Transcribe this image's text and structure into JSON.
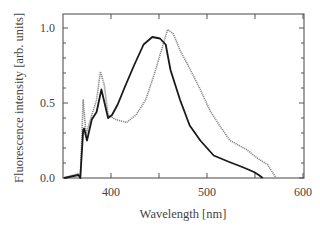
{
  "chart_data": {
    "type": "line",
    "title": "",
    "xlabel": "Wavelength [nm]",
    "ylabel": "Fluorescence intensity [arb. units]",
    "xlim": [
      350,
      600
    ],
    "ylim": [
      0.0,
      1.0
    ],
    "x_ticks": [
      400,
      500,
      600
    ],
    "x_minor_ticks": [
      450,
      550
    ],
    "y_ticks": [
      "0.0",
      "0.5",
      "1.0"
    ],
    "grid": false,
    "legend": null,
    "series": [
      {
        "name": "solid (black)",
        "color": "#1a1a1a",
        "style": "solid",
        "x": [
          351,
          366,
          368,
          371,
          372,
          375,
          380,
          385,
          390,
          397,
          401,
          407,
          414,
          424,
          434,
          443,
          451,
          457,
          462,
          472,
          482,
          493,
          507,
          522,
          538,
          549,
          554,
          558
        ],
        "y": [
          0.0,
          0.02,
          0.0,
          0.32,
          0.33,
          0.25,
          0.39,
          0.44,
          0.59,
          0.4,
          0.42,
          0.49,
          0.6,
          0.75,
          0.89,
          0.94,
          0.93,
          0.89,
          0.72,
          0.52,
          0.35,
          0.25,
          0.15,
          0.11,
          0.07,
          0.04,
          0.02,
          0.0
        ]
      },
      {
        "name": "dotted (grey)",
        "color": "#8a8a8a",
        "style": "dotted",
        "x": [
          351,
          366,
          368,
          371,
          374,
          380,
          385,
          389,
          393,
          397,
          405,
          416,
          426,
          436,
          445,
          451,
          459,
          465,
          472,
          482,
          493,
          503,
          513,
          524,
          541,
          553,
          563,
          572
        ],
        "y": [
          0.0,
          0.03,
          0.0,
          0.52,
          0.29,
          0.42,
          0.52,
          0.71,
          0.62,
          0.42,
          0.39,
          0.37,
          0.42,
          0.52,
          0.69,
          0.82,
          0.99,
          0.96,
          0.85,
          0.73,
          0.59,
          0.45,
          0.35,
          0.25,
          0.19,
          0.13,
          0.09,
          0.0
        ]
      }
    ]
  }
}
